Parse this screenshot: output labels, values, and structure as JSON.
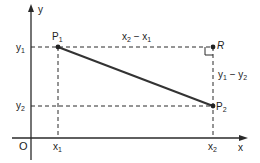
{
  "diagram": {
    "type": "coordinate-distance",
    "colors": {
      "ink": "#2a2a2a",
      "background": "#ffffff"
    },
    "axes": {
      "x_label": "x",
      "y_label": "y",
      "origin_label": "O"
    },
    "ticks": {
      "x": [
        {
          "base": "x",
          "sub": "1"
        },
        {
          "base": "x",
          "sub": "2"
        }
      ],
      "y": [
        {
          "base": "y",
          "sub": "1"
        },
        {
          "base": "y",
          "sub": "2"
        }
      ]
    },
    "points": {
      "P1": {
        "base": "P",
        "sub": "1"
      },
      "P2": {
        "base": "P",
        "sub": "2"
      },
      "R": {
        "base": "R"
      }
    },
    "annotations": {
      "horizontal": {
        "a": "x",
        "a_sub": "2",
        "op": " − ",
        "b": "x",
        "b_sub": "1"
      },
      "vertical": {
        "a": "y",
        "a_sub": "1",
        "op": " − ",
        "b": "y",
        "b_sub": "2"
      }
    },
    "right_angle_marker": "at R"
  }
}
